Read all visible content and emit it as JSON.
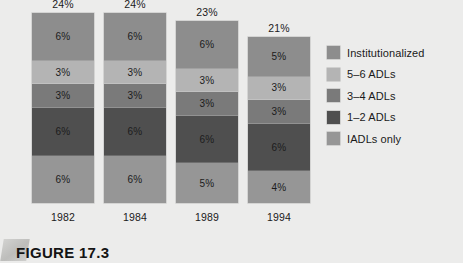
{
  "figure": {
    "caption": "FIGURE 17.3",
    "tab_icon": "folded-corner-tab"
  },
  "colors": {
    "background": "#ececeb",
    "institutionalized": "#8d8d8d",
    "adl_5_6": "#b4b4b4",
    "adl_3_4": "#7a7a7a",
    "adl_1_2": "#4f4f4f",
    "iadls_only": "#969696",
    "text": "#1a1a1a"
  },
  "legend": {
    "position": "right",
    "items": [
      {
        "label": "Institutionalized",
        "color": "#8d8d8d"
      },
      {
        "label": "5–6 ADLs",
        "color": "#b4b4b4"
      },
      {
        "label": "3–4 ADLs",
        "color": "#7a7a7a"
      },
      {
        "label": "1–2 ADLs",
        "color": "#4f4f4f"
      },
      {
        "label": "IADLs only",
        "color": "#969696"
      }
    ]
  },
  "chart_data": {
    "type": "bar",
    "subtype": "stacked-vertical",
    "title": "",
    "xlabel": "",
    "ylabel": "",
    "grid": false,
    "axis_visible": false,
    "legend_position": "right",
    "value_suffix": "%",
    "categories": [
      "1982",
      "1984",
      "1989",
      "1994"
    ],
    "totals": [
      "24%",
      "24%",
      "23%",
      "21%"
    ],
    "total_values": [
      24,
      24,
      23,
      21
    ],
    "stack_order_top_to_bottom": [
      "Institutionalized",
      "5–6 ADLs",
      "3–4 ADLs",
      "1–2 ADLs",
      "IADLs only"
    ],
    "series": [
      {
        "name": "Institutionalized",
        "color": "#8d8d8d",
        "values": [
          6,
          6,
          6,
          5
        ],
        "labels": [
          "6%",
          "6%",
          "6%",
          "5%"
        ]
      },
      {
        "name": "5–6 ADLs",
        "color": "#b4b4b4",
        "values": [
          3,
          3,
          3,
          3
        ],
        "labels": [
          "3%",
          "3%",
          "3%",
          "3%"
        ]
      },
      {
        "name": "3–4 ADLs",
        "color": "#7a7a7a",
        "values": [
          3,
          3,
          3,
          3
        ],
        "labels": [
          "3%",
          "3%",
          "3%",
          "3%"
        ]
      },
      {
        "name": "1–2 ADLs",
        "color": "#4f4f4f",
        "values": [
          6,
          6,
          6,
          6
        ],
        "labels": [
          "6%",
          "6%",
          "6%",
          "6%"
        ]
      },
      {
        "name": "IADLs only",
        "color": "#969696",
        "values": [
          6,
          6,
          5,
          4
        ],
        "labels": [
          "6%",
          "6%",
          "5%",
          "4%"
        ]
      }
    ]
  }
}
